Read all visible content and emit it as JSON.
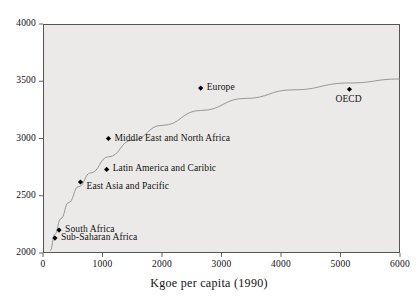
{
  "figure": {
    "xaxis_title": "Kgoe per capita (1990)",
    "background_color": "#eceae8",
    "frame_color": "#555555",
    "marker_color": "#000000",
    "curve_color": "#888888"
  },
  "chart_data": {
    "type": "scatter",
    "title": "",
    "subtitle": "",
    "xlabel": "Kgoe per capita (1990)",
    "ylabel": "",
    "xlim": [
      0,
      6000
    ],
    "ylim": [
      2000,
      4000
    ],
    "xticks": [
      "0",
      "1000",
      "2000",
      "3000",
      "4000",
      "5000",
      "6000"
    ],
    "xtick_values": [
      0,
      1000,
      2000,
      3000,
      4000,
      5000,
      6000
    ],
    "yticks": [
      "2000",
      "2500",
      "3000",
      "3500",
      "4000"
    ],
    "ytick_values": [
      2000,
      2500,
      3000,
      3500,
      4000
    ],
    "grid": false,
    "legend": "none",
    "points": [
      {
        "label": "Sub-Saharan Africa",
        "x": 200,
        "y": 2130,
        "label_side": "right"
      },
      {
        "label": "South Africa",
        "x": 270,
        "y": 2200,
        "label_side": "right"
      },
      {
        "label": "East Asia and Pacific",
        "x": 630,
        "y": 2620,
        "label_side": "right-below"
      },
      {
        "label": "Latin America and Caribic",
        "x": 1070,
        "y": 2730,
        "label_side": "right"
      },
      {
        "label": "Middle East and North Africa",
        "x": 1100,
        "y": 3000,
        "label_side": "right"
      },
      {
        "label": "Europe",
        "x": 2650,
        "y": 3440,
        "label_side": "right"
      },
      {
        "label": "OECD",
        "x": 5150,
        "y": 3430,
        "label_side": "below"
      }
    ],
    "fit_curve": {
      "description": "logarithmic trend line through the points",
      "points": [
        {
          "x": 120,
          "y": 2020
        },
        {
          "x": 200,
          "y": 2165
        },
        {
          "x": 300,
          "y": 2300
        },
        {
          "x": 430,
          "y": 2440
        },
        {
          "x": 600,
          "y": 2580
        },
        {
          "x": 800,
          "y": 2700
        },
        {
          "x": 1100,
          "y": 2840
        },
        {
          "x": 1500,
          "y": 2985
        },
        {
          "x": 2000,
          "y": 3115
        },
        {
          "x": 2650,
          "y": 3245
        },
        {
          "x": 3400,
          "y": 3350
        },
        {
          "x": 4200,
          "y": 3425
        },
        {
          "x": 5150,
          "y": 3485
        },
        {
          "x": 6000,
          "y": 3520
        }
      ]
    }
  }
}
